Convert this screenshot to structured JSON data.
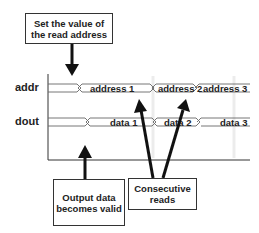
{
  "callouts": {
    "top": "Set the value of the read address",
    "bottom_left": "Output data becomes valid",
    "bottom_right": "Consecutive reads"
  },
  "signals": {
    "addr": {
      "name": "addr",
      "values": [
        "address 1",
        "address 2",
        "address 3"
      ]
    },
    "dout": {
      "name": "dout",
      "values": [
        "data 1",
        "data 2",
        "data 3"
      ]
    }
  },
  "colors": {
    "line": "#222222",
    "waveform": "#555555",
    "grid": "#e6e6e6"
  }
}
